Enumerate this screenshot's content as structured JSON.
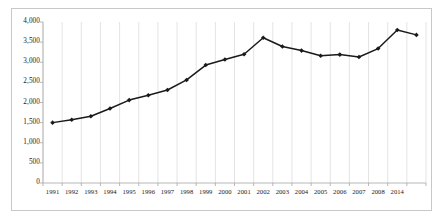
{
  "chart_data": {
    "type": "line",
    "title": "",
    "subtitle": "",
    "xlabel": "",
    "ylabel": "",
    "grid": "vertical",
    "legend": "none",
    "ylim": [
      0,
      4000
    ],
    "ytick_labels": [
      "0",
      "500",
      "1,000",
      "1,500",
      "2,000",
      "2,500",
      "3,000",
      "3,500",
      "4,000"
    ],
    "ytick_values": [
      0,
      500,
      1000,
      1500,
      2000,
      2500,
      3000,
      3500,
      4000
    ],
    "categories": [
      "1991",
      "1992",
      "1993",
      "1994",
      "1995",
      "1996",
      "1997",
      "1998",
      "1999",
      "2000",
      "2001",
      "2002",
      "2003",
      "2004",
      "2005",
      "2006",
      "2007",
      "2008",
      "2014",
      ""
    ],
    "values": [
      1500,
      1570,
      1660,
      1850,
      2060,
      2180,
      2310,
      2560,
      2930,
      3070,
      3200,
      3610,
      3390,
      3290,
      3160,
      3190,
      3130,
      3340,
      3800,
      3680
    ],
    "series": [
      {
        "name": "Series 1",
        "values": [
          1500,
          1570,
          1660,
          1850,
          2060,
          2180,
          2310,
          2560,
          2930,
          3070,
          3200,
          3610,
          3390,
          3290,
          3160,
          3190,
          3130,
          3340,
          3800,
          3680
        ],
        "color": "#1a1a1a",
        "marker": "diamond"
      }
    ]
  },
  "style": {
    "line_color": "#1a1a1a",
    "marker_color": "#1a1a1a",
    "gridline_color": "#d9d9d9",
    "axis_color": "#a6a6a6",
    "border_color": "#c8c8c8",
    "background": "#ffffff"
  }
}
